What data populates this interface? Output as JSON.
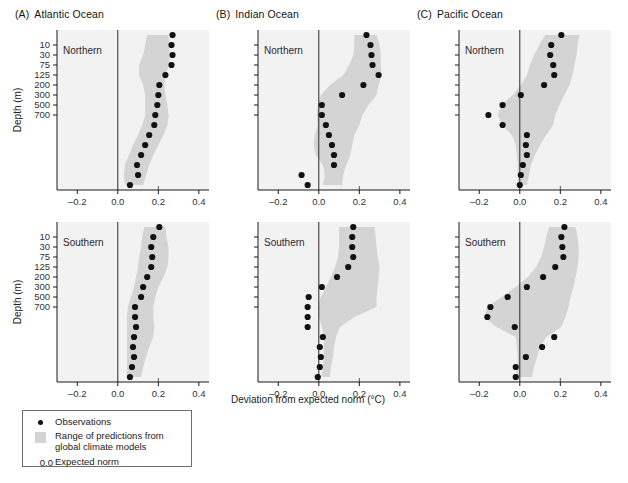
{
  "figure": {
    "xlabel": "Deviation from expected norm (°C)",
    "ylabel": "Depth (m)",
    "xticks": [
      "–0.2",
      "0.0",
      "0.2",
      "0.4"
    ],
    "xtick_values": [
      -0.2,
      0.0,
      0.2,
      0.4
    ],
    "xlim": [
      -0.3,
      0.45
    ],
    "yticks": [
      "10",
      "30",
      "75",
      "125",
      "200",
      "300",
      "500",
      "700"
    ],
    "hemispheres": [
      "Northern",
      "Southern"
    ]
  },
  "legend": {
    "observations_label": "Observations",
    "range_label": "Range of predictions from\nglobal climate models",
    "zero_value": "0.0",
    "expected_norm_label": "Expected norm",
    "observation_color": "#111111",
    "range_color": "#d4d4d4"
  },
  "panels": [
    {
      "letter": "(A)",
      "title": "Atlantic Ocean"
    },
    {
      "letter": "(B)",
      "title": "Indian Ocean"
    },
    {
      "letter": "(C)",
      "title": "Pacific Ocean"
    }
  ],
  "chart_data": {
    "type": "scatter",
    "title": "",
    "xlabel": "Deviation from expected norm (°C)",
    "ylabel": "Depth (m)",
    "xlim": [
      -0.3,
      0.45
    ],
    "xticks": [
      -0.2,
      0.0,
      0.2,
      0.4
    ],
    "ylabels": [
      "10",
      "30",
      "75",
      "125",
      "200",
      "300",
      "500",
      "700"
    ],
    "ytick_index": [
      1,
      2,
      3,
      4,
      5,
      6,
      7,
      8
    ],
    "n_levels": 16,
    "grid": false,
    "legend_position": "below-left",
    "reference_line": 0.0,
    "panels": [
      {
        "id": "A-Northern",
        "ocean": "Atlantic Ocean",
        "hemisphere": "Northern",
        "observations": [
          0.27,
          0.265,
          0.27,
          0.265,
          0.235,
          0.205,
          0.2,
          0.195,
          0.185,
          0.18,
          0.155,
          0.135,
          0.115,
          0.095,
          0.1,
          0.06
        ],
        "band_left": [
          0.145,
          0.135,
          0.125,
          0.105,
          0.105,
          0.125,
          0.135,
          0.135,
          0.135,
          0.12,
          0.1,
          0.075,
          0.055,
          0.035,
          0.03,
          0.035
        ],
        "band_right": [
          0.25,
          0.255,
          0.255,
          0.255,
          0.235,
          0.23,
          0.235,
          0.245,
          0.25,
          0.245,
          0.225,
          0.2,
          0.175,
          0.155,
          0.14,
          0.125
        ]
      },
      {
        "id": "B-Northern",
        "ocean": "Indian Ocean",
        "hemisphere": "Northern",
        "observations": [
          0.235,
          0.255,
          0.26,
          0.265,
          0.295,
          0.22,
          0.115,
          0.015,
          0.015,
          0.035,
          0.05,
          0.065,
          0.075,
          0.075,
          -0.085,
          -0.055
        ],
        "band_left": [
          0.175,
          0.175,
          0.17,
          0.15,
          0.12,
          0.055,
          0.01,
          -0.005,
          -0.01,
          -0.005,
          -0.02,
          -0.025,
          -0.015,
          0.02,
          0.03,
          0.02
        ],
        "band_right": [
          0.285,
          0.3,
          0.305,
          0.305,
          0.31,
          0.295,
          0.285,
          0.245,
          0.215,
          0.2,
          0.175,
          0.165,
          0.155,
          0.135,
          0.12,
          0.115
        ]
      },
      {
        "id": "C-Northern",
        "ocean": "Pacific Ocean",
        "hemisphere": "Northern",
        "observations": [
          0.205,
          0.155,
          0.15,
          0.165,
          0.17,
          0.12,
          0.005,
          -0.085,
          -0.155,
          -0.085,
          0.035,
          0.03,
          0.035,
          0.015,
          0.005,
          0.0
        ],
        "band_left": [
          0.125,
          0.095,
          0.07,
          0.05,
          0.035,
          0.005,
          -0.035,
          -0.09,
          -0.11,
          -0.085,
          -0.04,
          -0.02,
          -0.015,
          -0.01,
          -0.01,
          -0.01
        ],
        "band_right": [
          0.295,
          0.285,
          0.28,
          0.27,
          0.26,
          0.245,
          0.22,
          0.195,
          0.175,
          0.165,
          0.13,
          0.1,
          0.075,
          0.055,
          0.045,
          0.035
        ]
      },
      {
        "id": "A-Southern",
        "ocean": "Atlantic Ocean",
        "hemisphere": "Southern",
        "observations": [
          0.205,
          0.175,
          0.165,
          0.17,
          0.165,
          0.145,
          0.125,
          0.115,
          0.085,
          0.085,
          0.09,
          0.08,
          0.075,
          0.08,
          0.07,
          0.06
        ],
        "band_left": [
          0.13,
          0.12,
          0.115,
          0.105,
          0.1,
          0.09,
          0.08,
          0.065,
          0.05,
          0.045,
          0.045,
          0.045,
          0.045,
          0.045,
          0.045,
          0.045
        ],
        "band_right": [
          0.235,
          0.24,
          0.25,
          0.25,
          0.245,
          0.225,
          0.2,
          0.185,
          0.175,
          0.175,
          0.18,
          0.175,
          0.155,
          0.14,
          0.125,
          0.115
        ]
      },
      {
        "id": "B-Southern",
        "ocean": "Indian Ocean",
        "hemisphere": "Southern",
        "observations": [
          0.17,
          0.165,
          0.165,
          0.17,
          0.145,
          0.09,
          0.015,
          -0.05,
          -0.055,
          -0.055,
          -0.055,
          0.02,
          0.005,
          0.01,
          0.005,
          -0.005
        ],
        "band_left": [
          0.1,
          0.1,
          0.1,
          0.095,
          0.08,
          0.06,
          0.035,
          0.01,
          -0.005,
          0.0,
          0.015,
          0.025,
          0.025,
          0.025,
          0.02,
          0.015
        ],
        "band_right": [
          0.275,
          0.28,
          0.285,
          0.29,
          0.3,
          0.295,
          0.29,
          0.285,
          0.285,
          0.175,
          0.105,
          0.085,
          0.075,
          0.07,
          0.06,
          0.055
        ]
      },
      {
        "id": "C-Southern",
        "ocean": "Pacific Ocean",
        "hemisphere": "Southern",
        "observations": [
          0.22,
          0.205,
          0.21,
          0.215,
          0.175,
          0.115,
          0.035,
          -0.06,
          -0.145,
          -0.16,
          -0.025,
          0.17,
          0.11,
          0.03,
          -0.02,
          -0.02
        ],
        "band_left": [
          0.145,
          0.13,
          0.12,
          0.105,
          0.08,
          0.04,
          -0.02,
          -0.09,
          -0.16,
          -0.175,
          -0.115,
          -0.02,
          -0.015,
          -0.01,
          -0.015,
          -0.015
        ],
        "band_right": [
          0.275,
          0.285,
          0.29,
          0.29,
          0.285,
          0.275,
          0.265,
          0.25,
          0.24,
          0.225,
          0.205,
          0.13,
          0.1,
          0.085,
          0.07,
          0.06
        ]
      }
    ]
  }
}
